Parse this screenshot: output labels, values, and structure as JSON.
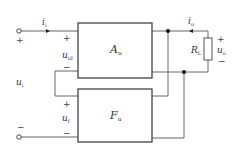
{
  "diagram": {
    "type": "negative-feedback-amplifier-block-diagram",
    "blocks": [
      {
        "id": "amplifier",
        "label": "A",
        "subscript": "u"
      },
      {
        "id": "feedback",
        "label": "F",
        "subscript": "u"
      }
    ],
    "signals": {
      "input_current": {
        "label": "i",
        "subscript": "i"
      },
      "output_current": {
        "label": "i",
        "subscript": "o"
      },
      "input_voltage": {
        "label": "u",
        "subscript": "i"
      },
      "diff_voltage": {
        "label": "u",
        "subscript": "id"
      },
      "feedback_voltage": {
        "label": "u",
        "subscript": "f"
      },
      "output_voltage": {
        "label": "u",
        "subscript": "o"
      }
    },
    "load": {
      "label": "R",
      "subscript": "L"
    },
    "polarity": {
      "plus": "+",
      "minus": "−"
    },
    "colors": {
      "line": "#555555",
      "box": "#444444",
      "node": "#111111"
    }
  }
}
